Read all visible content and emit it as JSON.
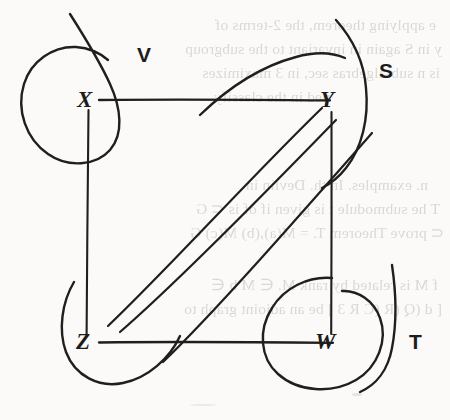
{
  "figure": {
    "kind": "hand-drawn graph diagram",
    "ink_color": "#1f1f1f",
    "paper_color": "#fbfbf9",
    "vertices": [
      {
        "id": "X",
        "label": "X",
        "x": 88,
        "y": 100
      },
      {
        "id": "Y",
        "label": "Y",
        "x": 330,
        "y": 100
      },
      {
        "id": "Z",
        "label": "Z",
        "x": 86,
        "y": 342
      },
      {
        "id": "W",
        "label": "W",
        "x": 330,
        "y": 342
      }
    ],
    "edges": [
      {
        "from": "X",
        "to": "Y",
        "style": "horizontal"
      },
      {
        "from": "Z",
        "to": "W",
        "style": "horizontal"
      },
      {
        "from": "X",
        "to": "Z",
        "style": "vertical"
      },
      {
        "from": "Y",
        "to": "W",
        "style": "vertical"
      },
      {
        "from": "Z",
        "to": "Y",
        "style": "diagonal"
      },
      {
        "from": "Z",
        "to": "W",
        "style": "diagonal-curve"
      }
    ],
    "regions": [
      {
        "id": "V",
        "label": "V",
        "encloses": "X",
        "label_x": 137,
        "label_y": 44
      },
      {
        "id": "S",
        "label": "S",
        "encloses": "Y",
        "label_x": 379,
        "label_y": 60
      },
      {
        "id": "T",
        "label": "T",
        "encloses": "W",
        "label_x": 409,
        "label_y": 331
      },
      {
        "id": "unlabeled-z",
        "label": "",
        "encloses": "Z",
        "label_x": 0,
        "label_y": 0
      }
    ]
  },
  "ghost_text": {
    "note": "mirrored bleed-through from the reverse page",
    "lines": [
      {
        "text": "e applying theorem, the 2-terms of",
        "x": 14,
        "y": 16
      },
      {
        "text": "y in S again in invariant to the subgroup",
        "x": 8,
        "y": 40
      },
      {
        "text": "is n sub-algebras sec, in 3 maximizes",
        "x": 10,
        "y": 64
      },
      {
        "text": "ned in the classify",
        "x": 120,
        "y": 88
      },
      {
        "text": "n. examples.   In th.   Devlin in",
        "x": 22,
        "y": 176
      },
      {
        "text": "T  he submodule  t  is given  if  of  is  ⊂ G",
        "x": 10,
        "y": 200
      },
      {
        "text": "⊂  prove  Theorem T.  =  M(a),(b)  M(c)  G",
        "x": 6,
        "y": 224
      },
      {
        "text": "f  M  is related by rank M.   ∈ M  b  ∈",
        "x": 12,
        "y": 276
      },
      {
        "text": "[ d (Q (R (C R 3 ]  be an adjoint graph to",
        "x": 8,
        "y": 300
      }
    ]
  }
}
